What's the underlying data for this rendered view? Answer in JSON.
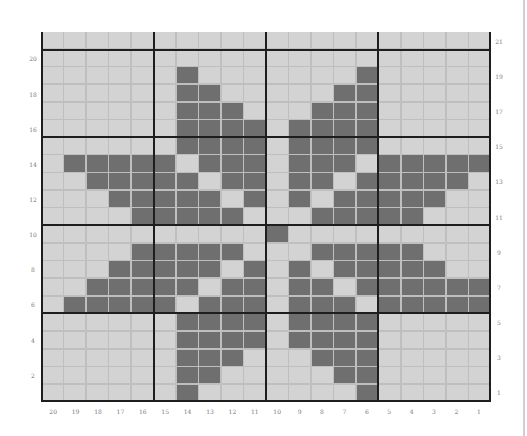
{
  "chart_data": {
    "type": "table",
    "title": "",
    "columns": 20,
    "rows": 21,
    "column_labels": [
      "20",
      "19",
      "18",
      "17",
      "16",
      "15",
      "14",
      "13",
      "12",
      "11",
      "10",
      "9",
      "8",
      "7",
      "6",
      "5",
      "4",
      "3",
      "2",
      "1"
    ],
    "left_row_labels": [
      "20",
      "18",
      "16",
      "14",
      "12",
      "10",
      "8",
      "6",
      "4",
      "2"
    ],
    "right_row_labels": [
      "21",
      "19",
      "17",
      "15",
      "13",
      "11",
      "9",
      "7",
      "5",
      "3",
      "1"
    ],
    "grid_rows_top_to_bottom": [
      {
        "row": 21,
        "cells": "00000000000000000000"
      },
      {
        "row": 20,
        "cells": "00000000000000000000"
      },
      {
        "row": 19,
        "cells": "00000010000000100000"
      },
      {
        "row": 18,
        "cells": "00000011000001100000"
      },
      {
        "row": 17,
        "cells": "00000011100011100000"
      },
      {
        "row": 16,
        "cells": "00000011110111100000"
      },
      {
        "row": 15,
        "cells": "00000011110111100000"
      },
      {
        "row": 14,
        "cells": "01111101110111011111"
      },
      {
        "row": 13,
        "cells": "00111110110110111110"
      },
      {
        "row": 12,
        "cells": "00011111010101111100"
      },
      {
        "row": 11,
        "cells": "00001111100011111000"
      },
      {
        "row": 10,
        "cells": "00000000001000000000"
      },
      {
        "row": 9,
        "cells": "00001111100011111000"
      },
      {
        "row": 8,
        "cells": "00011111010101111100"
      },
      {
        "row": 7,
        "cells": "00111110110110111111"
      },
      {
        "row": 6,
        "cells": "01111101110111011111"
      },
      {
        "row": 5,
        "cells": "00000011110111100000"
      },
      {
        "row": 4,
        "cells": "00000011110111100000"
      },
      {
        "row": 3,
        "cells": "00000011100011100000"
      },
      {
        "row": 2,
        "cells": "00000011000001100000"
      },
      {
        "row": 1,
        "cells": "00000010000000100000"
      }
    ],
    "legend": {
      "filled": "contrast color",
      "empty": "main color"
    },
    "colors": {
      "filled": "#6f6f6f",
      "empty": "#d3d3d3",
      "grid_line": "#bfbfbf",
      "major_line": "#1e1e1e"
    },
    "major_lines_every": 5
  }
}
